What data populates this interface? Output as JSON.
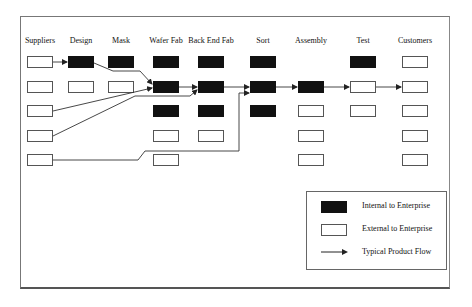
{
  "diagram": {
    "columns": [
      {
        "label": "Suppliers",
        "center_x": 40
      },
      {
        "label": "Design",
        "center_x": 81
      },
      {
        "label": "Mask",
        "center_x": 121
      },
      {
        "label": "Wafer Fab",
        "center_x": 166
      },
      {
        "label": "Back End Fab",
        "center_x": 211
      },
      {
        "label": "Sort",
        "center_x": 263
      },
      {
        "label": "Assembly",
        "center_x": 311
      },
      {
        "label": "Test",
        "center_x": 363
      },
      {
        "label": "Customers",
        "center_x": 415
      }
    ],
    "rows_y": [
      56,
      81,
      105,
      130,
      154
    ],
    "cells": {
      "Suppliers": [
        "external",
        "external",
        "external",
        "external",
        "external"
      ],
      "Design": [
        "internal",
        "external",
        null,
        null,
        null
      ],
      "Mask": [
        "internal",
        "external",
        null,
        null,
        null
      ],
      "Wafer Fab": [
        "internal",
        "internal",
        "internal",
        "external",
        "external"
      ],
      "Back End Fab": [
        "internal",
        "internal",
        "internal",
        "external",
        null
      ],
      "Sort": [
        "internal",
        "internal",
        "internal",
        null,
        null
      ],
      "Assembly": [
        null,
        "internal",
        "external",
        "external",
        "external"
      ],
      "Test": [
        "internal",
        "external",
        "external",
        null,
        null
      ],
      "Customers": [
        "external",
        "external",
        "external",
        "external",
        "external"
      ]
    },
    "flows": [
      {
        "from": "Suppliers row1",
        "to": "Design row1"
      },
      {
        "from": "Design row1",
        "to": "Wafer Fab row2"
      },
      {
        "from": "Suppliers row3",
        "to": "Wafer Fab row2"
      },
      {
        "from": "Suppliers row4",
        "to": "Back End Fab row2"
      },
      {
        "from": "Wafer Fab row2",
        "to": "Back End Fab row2"
      },
      {
        "from": "Back End Fab row2",
        "to": "Sort row2"
      },
      {
        "from": "Suppliers row5",
        "to": "Sort row2"
      },
      {
        "from": "Sort row2",
        "to": "Assembly row2"
      },
      {
        "from": "Assembly row2",
        "to": "Test row2"
      },
      {
        "from": "Test row2",
        "to": "Customers row2"
      }
    ],
    "colors": {
      "internal": "#111111",
      "external": "#ffffff",
      "line": "#333333"
    }
  },
  "legend": {
    "items": [
      {
        "type": "internal",
        "label": "Internal to Enterprise"
      },
      {
        "type": "external",
        "label": "External to Enterprise"
      },
      {
        "type": "arrow",
        "label": "Typical Product Flow"
      }
    ]
  }
}
